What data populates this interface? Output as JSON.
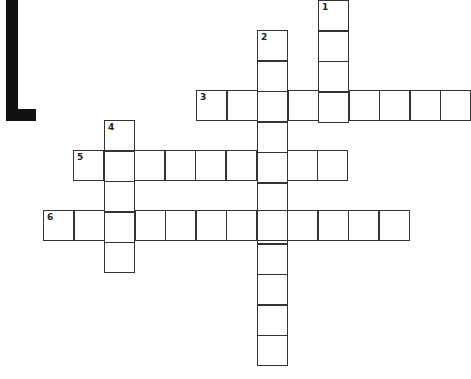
{
  "puzzle": {
    "type": "crossword",
    "cell_size": 30.5,
    "corner_mark": "black-L-bracket",
    "entries": [
      {
        "number": "1",
        "direction": "down",
        "x": 318,
        "y": 0,
        "length": 4
      },
      {
        "number": "2",
        "direction": "down",
        "x": 257,
        "y": 30,
        "length": 11
      },
      {
        "number": "3",
        "direction": "across",
        "x": 196,
        "y": 90,
        "length": 9
      },
      {
        "number": "4",
        "direction": "down",
        "x": 104,
        "y": 120,
        "length": 5
      },
      {
        "number": "5",
        "direction": "across",
        "x": 73,
        "y": 150,
        "length": 9
      },
      {
        "number": "6",
        "direction": "across",
        "x": 43,
        "y": 210,
        "length": 12
      }
    ]
  }
}
